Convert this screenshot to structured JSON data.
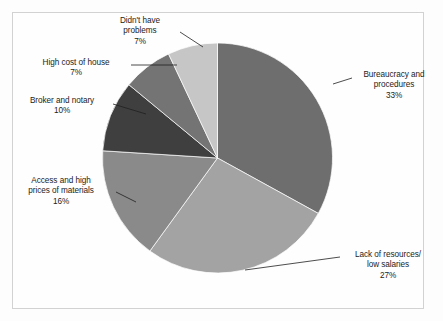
{
  "figure": {
    "background_color": "#fdfdfd",
    "frame_color": "#d2d2d2",
    "label_text_color": "#1c1c1c",
    "leader_line_color": "#1f1f1f"
  },
  "chart_data": {
    "type": "pie",
    "title": "",
    "subtitle": "",
    "xlabel": "",
    "ylabel": "",
    "legend_position": "none",
    "grid": false,
    "labels_outside": true,
    "start_angle_deg": 0,
    "direction": "clockwise",
    "categories": [
      "Bureaucracy and procedures",
      "Lack of resources/ low salaries",
      "Access and high prices of materials",
      "Broker and notary",
      "High cost of house",
      "Didn't have problems"
    ],
    "values": [
      33,
      27,
      16,
      10,
      7,
      7
    ],
    "value_labels": [
      "33%",
      "27%",
      "16%",
      "10%",
      "7%",
      "7%"
    ],
    "colors": [
      "#6e6e6e",
      "#a3a3a3",
      "#8a8a8a",
      "#3f3f3f",
      "#747474",
      "#c6c6c6"
    ],
    "total": 100,
    "units": "%"
  },
  "labels": {
    "bureaucracy": {
      "line1": "Bureaucracy and",
      "line2": "procedures",
      "pct": "33%"
    },
    "lack_of_resources": {
      "line1": "Lack of resources/",
      "line2": "low salaries",
      "pct": "27%"
    },
    "access_materials": {
      "line1": "Access and high",
      "line2": "prices of materials",
      "pct": "16%"
    },
    "broker_notary": {
      "line1": "Broker and notary",
      "line2": "",
      "pct": "10%"
    },
    "high_cost_house": {
      "line1": "High cost of house",
      "line2": "",
      "pct": "7%"
    },
    "didnt_have_problems": {
      "line1": "Didn't have",
      "line2": "problems",
      "pct": "7%"
    }
  }
}
